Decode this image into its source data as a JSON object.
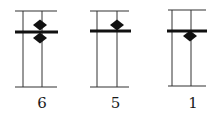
{
  "figures": [
    {
      "label": "6",
      "frame": {
        "x1": 15,
        "x2": 57,
        "top": 11,
        "bottom": 87
      },
      "verticals": [
        23,
        42
      ],
      "bar": {
        "x1": 15,
        "x2": 58,
        "y": 32
      },
      "diamonds": [
        {
          "cx": 40,
          "cy": 25
        },
        {
          "cx": 40,
          "cy": 38
        }
      ]
    },
    {
      "label": "5",
      "frame": {
        "x1": 90,
        "x2": 129,
        "top": 11,
        "bottom": 87
      },
      "verticals": [
        97,
        117
      ],
      "bar": {
        "x1": 90,
        "x2": 131,
        "y": 31
      },
      "diamonds": [
        {
          "cx": 117,
          "cy": 25
        }
      ]
    },
    {
      "label": "1",
      "frame": {
        "x1": 168,
        "x2": 206,
        "top": 10,
        "bottom": 86
      },
      "verticals": [
        172,
        191
      ],
      "bar": {
        "x1": 167,
        "x2": 207,
        "y": 31
      },
      "diamonds": [
        {
          "cx": 190,
          "cy": 36
        }
      ]
    }
  ],
  "colors": {
    "line": "#333333",
    "bar": "#111111",
    "diamond": "#111111"
  }
}
